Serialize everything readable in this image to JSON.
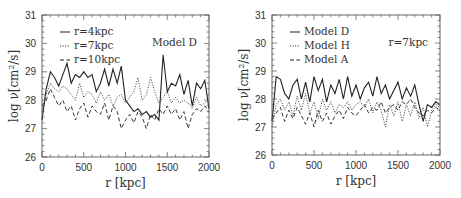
{
  "chart_data": [
    {
      "type": "line",
      "title": "",
      "annotation": "Model D",
      "xlabel": "r [kpc]",
      "ylabel": "log ν[cm²/s]",
      "xlim": [
        0,
        2000
      ],
      "ylim": [
        26,
        31
      ],
      "xticks": [
        "0",
        "500",
        "1000",
        "1500",
        "2000"
      ],
      "yticks": [
        "26",
        "27",
        "28",
        "29",
        "30",
        "31"
      ],
      "grid": false,
      "legend_position": "upper left",
      "x": [
        0,
        50,
        100,
        150,
        200,
        250,
        300,
        350,
        400,
        450,
        500,
        550,
        600,
        650,
        700,
        750,
        800,
        850,
        900,
        950,
        1000,
        1050,
        1100,
        1150,
        1200,
        1250,
        1300,
        1350,
        1400,
        1450,
        1500,
        1550,
        1600,
        1650,
        1700,
        1750,
        1800,
        1850,
        1900,
        1950,
        2000
      ],
      "series": [
        {
          "name": "r=4kpc",
          "style": "solid",
          "values": [
            27.3,
            28.4,
            29.0,
            28.8,
            28.5,
            28.9,
            29.3,
            28.6,
            28.9,
            28.8,
            29.0,
            28.8,
            28.9,
            28.3,
            28.6,
            29.1,
            28.5,
            29.1,
            28.6,
            29.2,
            28.0,
            27.8,
            27.6,
            27.7,
            27.5,
            27.6,
            27.4,
            27.5,
            27.3,
            29.6,
            28.3,
            28.6,
            28.5,
            28.9,
            28.2,
            28.7,
            27.8,
            28.6,
            28.4,
            28.7,
            27.7
          ]
        },
        {
          "name": "r=7kpc",
          "style": "dotted",
          "values": [
            27.6,
            28.2,
            28.6,
            28.4,
            28.3,
            28.5,
            28.4,
            28.2,
            28.0,
            28.6,
            28.1,
            28.3,
            28.2,
            27.9,
            28.3,
            28.0,
            28.2,
            27.8,
            28.1,
            28.2,
            27.9,
            28.1,
            28.3,
            28.8,
            28.0,
            28.2,
            28.8,
            28.3,
            27.9,
            28.1,
            28.3,
            27.9,
            28.1,
            27.9,
            28.0,
            27.9,
            27.7,
            28.1,
            27.8,
            27.9,
            28.0
          ]
        },
        {
          "name": "r=10kpc",
          "style": "dashed",
          "values": [
            27.8,
            28.0,
            28.4,
            28.1,
            27.8,
            28.0,
            27.6,
            27.8,
            27.3,
            27.7,
            27.9,
            27.4,
            27.8,
            27.6,
            27.5,
            27.9,
            27.3,
            27.8,
            27.6,
            27.0,
            27.3,
            27.5,
            27.2,
            27.6,
            27.4,
            27.0,
            27.5,
            27.3,
            27.7,
            27.5,
            27.8,
            27.5,
            27.7,
            27.3,
            27.6,
            27.0,
            27.5,
            27.7,
            27.6,
            27.8,
            27.6
          ]
        }
      ]
    },
    {
      "type": "line",
      "title": "",
      "annotation": "r=7kpc",
      "xlabel": "r [kpc]",
      "ylabel": "log ν[cm²/s]",
      "xlim": [
        0,
        2000
      ],
      "ylim": [
        26,
        31
      ],
      "xticks": [
        "0",
        "500",
        "1000",
        "1500",
        "2000"
      ],
      "yticks": [
        "26",
        "27",
        "28",
        "29",
        "30",
        "31"
      ],
      "grid": false,
      "legend_position": "upper left",
      "x": [
        0,
        50,
        100,
        150,
        200,
        250,
        300,
        350,
        400,
        450,
        500,
        550,
        600,
        650,
        700,
        750,
        800,
        850,
        900,
        950,
        1000,
        1050,
        1100,
        1150,
        1200,
        1250,
        1300,
        1350,
        1400,
        1450,
        1500,
        1550,
        1600,
        1650,
        1700,
        1750,
        1800,
        1850,
        1900,
        1950,
        2000
      ],
      "series": [
        {
          "name": "Model D",
          "style": "solid",
          "values": [
            27.2,
            28.8,
            28.7,
            28.2,
            28.0,
            28.5,
            28.7,
            28.0,
            28.6,
            27.9,
            28.8,
            28.3,
            28.7,
            27.9,
            28.5,
            28.2,
            28.7,
            28.0,
            28.8,
            28.1,
            28.5,
            28.0,
            28.4,
            28.6,
            28.1,
            28.8,
            28.2,
            28.5,
            28.0,
            28.3,
            28.6,
            28.0,
            28.4,
            28.1,
            28.5,
            27.8,
            27.2,
            27.8,
            27.7,
            27.9,
            27.8
          ]
        },
        {
          "name": "Model H",
          "style": "dotted",
          "values": [
            27.0,
            27.8,
            28.0,
            27.6,
            27.9,
            27.4,
            28.1,
            27.6,
            28.2,
            27.5,
            27.9,
            27.3,
            28.0,
            27.6,
            27.9,
            27.5,
            27.8,
            27.7,
            27.9,
            27.6,
            27.8,
            27.9,
            27.7,
            28.0,
            27.5,
            27.9,
            27.6,
            27.0,
            27.8,
            27.4,
            27.9,
            27.2,
            27.8,
            27.4,
            27.9,
            27.3,
            27.7,
            27.0,
            27.6,
            27.8,
            27.7
          ]
        },
        {
          "name": "Model A",
          "style": "dashed",
          "values": [
            27.3,
            27.5,
            27.7,
            27.2,
            27.6,
            27.3,
            27.7,
            27.4,
            27.1,
            27.5,
            27.0,
            27.6,
            27.2,
            27.5,
            27.1,
            27.4,
            27.6,
            27.3,
            27.7,
            27.5,
            27.4,
            27.6,
            27.8,
            27.5,
            27.7,
            27.6,
            27.9,
            27.5,
            27.7,
            27.8,
            27.6,
            27.9,
            27.8,
            28.0,
            27.7,
            27.5,
            27.4,
            27.6,
            27.5,
            27.7,
            27.6
          ]
        }
      ]
    }
  ],
  "panels": [
    {
      "legend": [
        {
          "label": "r=4kpc",
          "style": "solid"
        },
        {
          "label": "r=7kpc",
          "style": "dotted"
        },
        {
          "label": "r=10kpc",
          "style": "dashed"
        }
      ],
      "annotation": "Model D",
      "xlabel": "r [kpc]",
      "ylabel": "log ν[cm²/s]"
    },
    {
      "legend": [
        {
          "label": "Model D",
          "style": "solid"
        },
        {
          "label": "Model H",
          "style": "dotted"
        },
        {
          "label": "Model A",
          "style": "dashed"
        }
      ],
      "annotation": "r=7kpc",
      "xlabel": "r [kpc]",
      "ylabel": "log ν[cm²/s]"
    }
  ],
  "colors": {
    "line": "#222222",
    "frame": "#555555",
    "text": "#333333",
    "background": "#ffffff"
  }
}
